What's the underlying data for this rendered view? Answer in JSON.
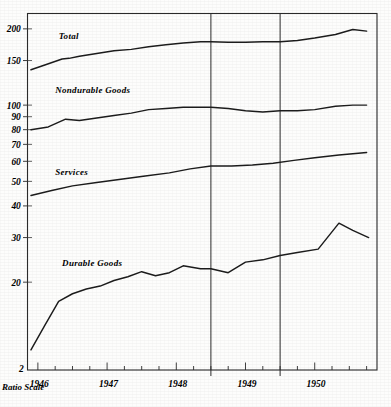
{
  "chart_data": {
    "type": "line",
    "title": "",
    "subtitle": "",
    "xlabel": "",
    "ylabel": "",
    "scale_note": "Ratio Scale",
    "y_scale": "log",
    "grid": false,
    "legend_position": "inline-labels",
    "ylim": [
      9,
      230
    ],
    "y_ticks": [
      20,
      30,
      40,
      50,
      60,
      70,
      80,
      90,
      100,
      150,
      200
    ],
    "y_tick_labels": [
      "20",
      "30",
      "40",
      "50",
      "60",
      "70",
      "80",
      "90",
      "100",
      "150",
      "200"
    ],
    "x_tick_labels": [
      "1946",
      "1947",
      "1948",
      "1949",
      "1950"
    ],
    "x_year_positions": [
      1946,
      1947,
      1948,
      1949,
      1950
    ],
    "xlim": [
      1945.85,
      1950.9
    ],
    "annotations": [
      {
        "name": "recession-line-1",
        "x": 1948.5,
        "label": ""
      },
      {
        "name": "recession-line-2",
        "x": 1949.5,
        "label": ""
      }
    ],
    "series": [
      {
        "name": "Total",
        "label_x": 1946.3,
        "label_y": 183,
        "x": [
          1945.9,
          1946.1,
          1946.35,
          1946.45,
          1946.6,
          1946.85,
          1947.1,
          1947.35,
          1947.6,
          1947.85,
          1948.1,
          1948.35,
          1948.5,
          1948.75,
          1949.0,
          1949.25,
          1949.5,
          1949.75,
          1950.0,
          1950.3,
          1950.55,
          1950.75
        ],
        "values": [
          138,
          144,
          152,
          153,
          156,
          160,
          164,
          166,
          170,
          173,
          176,
          178,
          178,
          177,
          177,
          178,
          178,
          180,
          184,
          190,
          199,
          196
        ]
      },
      {
        "name": "Nondurable Goods",
        "label_x": 1946.25,
        "label_y": 112,
        "x": [
          1945.9,
          1946.15,
          1946.4,
          1946.6,
          1946.85,
          1947.1,
          1947.35,
          1947.6,
          1947.85,
          1948.1,
          1948.35,
          1948.5,
          1948.75,
          1949.0,
          1949.25,
          1949.5,
          1949.75,
          1950.0,
          1950.3,
          1950.55,
          1950.75
        ],
        "values": [
          80,
          82,
          88,
          87,
          89,
          91,
          93,
          96,
          97,
          98,
          98,
          98,
          97,
          95,
          94,
          95,
          95,
          96,
          99,
          100,
          100
        ]
      },
      {
        "name": "Services",
        "label_x": 1946.25,
        "label_y": 53,
        "x": [
          1945.9,
          1946.2,
          1946.5,
          1946.85,
          1947.2,
          1947.55,
          1947.9,
          1948.2,
          1948.5,
          1948.8,
          1949.1,
          1949.4,
          1949.7,
          1950.0,
          1950.35,
          1950.75
        ],
        "values": [
          44,
          46,
          48,
          49.5,
          51,
          52.5,
          54,
          56,
          57.5,
          57.5,
          58,
          59,
          60.5,
          62,
          63.5,
          65
        ]
      },
      {
        "name": "Durable Goods",
        "label_x": 1946.35,
        "label_y": 23.2,
        "x": [
          1945.9,
          1946.1,
          1946.3,
          1946.5,
          1946.7,
          1946.9,
          1947.1,
          1947.3,
          1947.5,
          1947.7,
          1947.9,
          1948.1,
          1948.35,
          1948.5,
          1948.75,
          1949.0,
          1949.25,
          1949.5,
          1949.75,
          1950.05,
          1950.35,
          1950.55,
          1950.78
        ],
        "values": [
          10.8,
          13.5,
          16.8,
          18.0,
          18.8,
          19.3,
          20.3,
          21.0,
          22.0,
          21.2,
          21.8,
          23.2,
          22.6,
          22.6,
          21.8,
          24.0,
          24.5,
          25.5,
          26.2,
          27.0,
          34.2,
          32.0,
          30.0
        ]
      }
    ]
  },
  "axis": {
    "ratio_scale_label": "Ratio Scale"
  }
}
